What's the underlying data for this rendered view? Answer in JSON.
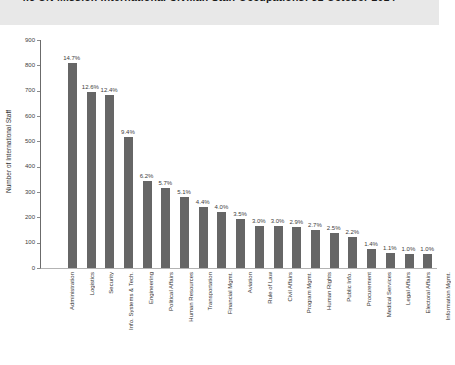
{
  "header": {
    "title": "4.5  UN Mission International Civilian Staff Occupations: 31 October 2014"
  },
  "colors": {
    "header_band": "#e8e8e8",
    "bar": "#666666",
    "axis_line": "#6b6b6b",
    "baseline": "#b3b3b3",
    "label_text": "#404040"
  },
  "chart_data": {
    "type": "bar",
    "title": "UN Mission International Civilian Staff Occupations: 31 October 2014",
    "xlabel": "",
    "ylabel": "Number of International Staff",
    "ylim": [
      0,
      900
    ],
    "yticks": [
      0,
      100,
      200,
      300,
      400,
      500,
      600,
      700,
      800,
      900
    ],
    "grid": false,
    "legend": "none",
    "categories": [
      "Administration",
      "Logistics",
      "Security",
      "Info. Systems & Tech.",
      "Engineering",
      "Political Affairs",
      "Human Resources",
      "Transportation",
      "Financial Mgmt.",
      "Aviation",
      "Rule of Law",
      "Civil Affairs",
      "Program Mgmt.",
      "Human Rights",
      "Public Info.",
      "Procurement",
      "Medical Services",
      "Legal Affairs",
      "Electoral Affairs",
      "Information Mgmt."
    ],
    "values": [
      810,
      695,
      683,
      518,
      342,
      314,
      281,
      242,
      220,
      193,
      165,
      165,
      160,
      149,
      138,
      121,
      77,
      61,
      55,
      55
    ],
    "percent_labels": [
      "14.7%",
      "12.6%",
      "12.4%",
      "9.4%",
      "6.2%",
      "5.7%",
      "5.1%",
      "4.4%",
      "4.0%",
      "3.5%",
      "3.0%",
      "3.0%",
      "2.9%",
      "2.7%",
      "2.5%",
      "2.2%",
      "1.4%",
      "1.1%",
      "1.0%",
      "1.0%"
    ]
  }
}
